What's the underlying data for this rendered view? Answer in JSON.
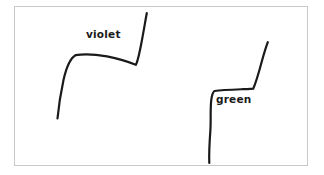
{
  "figure": {
    "background_color": "#ffffff",
    "ink_color": "#1a1a1a",
    "frame": {
      "name": "figure-border",
      "stroke_color": "#c9c9c9",
      "x": 14,
      "y": 6,
      "width": 294,
      "height": 160
    },
    "labels": [
      {
        "id": "violet",
        "text": "violet",
        "x": 86,
        "y": 29
      },
      {
        "id": "green",
        "text": "green",
        "x": 216,
        "y": 94
      }
    ],
    "curves": [
      {
        "id": "violet",
        "label": "violet",
        "stroke_width": 2.2,
        "path": "M 57.5 118.5 C 58.5 108 60.5 94 63.5 80 C 66.5 66.5 70 58.5 75.5 55.2 C 84 53.6 96 54.4 107 56.4 C 118 58.6 128 61.6 135.8 64.8 C 137.6 62.0 139.5 53.0 141.6 42.0 C 143.6 31.5 145.4 20.5 146.8 13.0"
      },
      {
        "id": "green",
        "label": "green",
        "stroke_width": 2.2,
        "path": "M 209.3 163.0 C 208.8 152.0 209.6 141.0 210.4 130.0 C 211.0 120.0 210.2 110.0 211.2 100.5 C 211.8 95.6 212.6 92.4 214.4 91.0 C 222.0 90.0 233.0 89.6 243.0 89.2 C 248.0 89.0 251.0 89.0 253.2 88.7 C 255.8 83.0 259.0 72.0 262.2 60.0 C 264.6 51.5 266.6 45.5 267.8 42.2"
      }
    ]
  }
}
